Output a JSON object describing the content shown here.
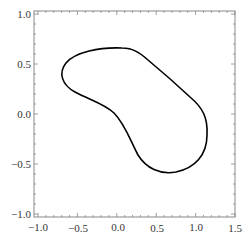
{
  "chart_data": {
    "type": "line",
    "title": "",
    "xlabel": "",
    "ylabel": "",
    "xlim": [
      -1.05,
      1.5
    ],
    "ylim": [
      -1.03,
      1.03
    ],
    "grid": false,
    "legend": null,
    "x_ticks": [
      "-1.0",
      "-0.5",
      "0.0",
      "0.5",
      "1.0",
      "1.5"
    ],
    "y_ticks": [
      "1.0",
      "0.5",
      "0.0",
      "-0.5",
      "-1.0"
    ],
    "series": [
      {
        "name": "closed curve",
        "closed": true,
        "color": "#000000",
        "points": [
          [
            0.07,
            0.66
          ],
          [
            -0.2,
            0.62
          ],
          [
            -0.45,
            0.55
          ],
          [
            -0.62,
            0.42
          ],
          [
            -0.6,
            0.28
          ],
          [
            -0.4,
            0.17
          ],
          [
            -0.15,
            0.08
          ],
          [
            0.05,
            -0.05
          ],
          [
            0.2,
            -0.3
          ],
          [
            0.35,
            -0.5
          ],
          [
            0.6,
            -0.59
          ],
          [
            0.85,
            -0.55
          ],
          [
            1.05,
            -0.3
          ],
          [
            1.07,
            -0.05
          ],
          [
            0.9,
            0.2
          ],
          [
            0.6,
            0.45
          ],
          [
            0.35,
            0.6
          ],
          [
            0.07,
            0.66
          ]
        ]
      }
    ]
  },
  "axes": {
    "x_labels": [
      "−1.0",
      "−0.5",
      "0.0",
      "0.5",
      "1.0",
      "1.5"
    ],
    "y_labels": [
      "1.0",
      "0.5",
      "0.0",
      "−0.5",
      "−1.0"
    ]
  }
}
